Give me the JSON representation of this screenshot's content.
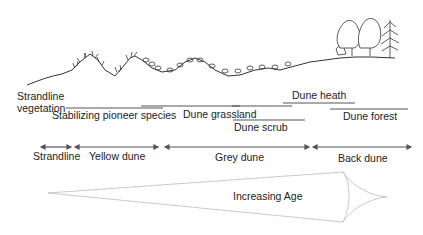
{
  "diagram": {
    "vegetation_zones": [
      {
        "label": "Strandline\nvegetation",
        "line1": "Strandline",
        "line2": "vegetation"
      },
      {
        "label": "Stabilizing pioneer species"
      },
      {
        "label": "Dune grassland"
      },
      {
        "label": "Dune scrub"
      },
      {
        "label": "Dune heath"
      },
      {
        "label": "Dune forest"
      }
    ],
    "dune_zones": [
      {
        "label": "Strandline"
      },
      {
        "label": "Yellow dune"
      },
      {
        "label": "Grey dune"
      },
      {
        "label": "Back dune"
      }
    ],
    "age_arrow": {
      "label": "Increasing Age"
    },
    "colors": {
      "line": "#555555",
      "text": "#222222",
      "age_arrow": "#bbbbbb"
    }
  }
}
